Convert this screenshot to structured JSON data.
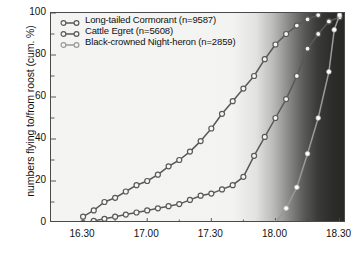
{
  "chart_data": {
    "type": "line",
    "title": "",
    "xlabel": "",
    "ylabel": "numbers flying to/from roost (cum. %)",
    "xlim": [
      16.25,
      18.55
    ],
    "ylim": [
      0,
      100
    ],
    "grid": false,
    "legend_position": "top-left",
    "annotations": [
      "shaded dark band at right of plot indicates nightfall / darkness"
    ],
    "xticks": [
      {
        "value": 16.5,
        "label": "16.30"
      },
      {
        "value": 17.0,
        "label": "17.00"
      },
      {
        "value": 17.5,
        "label": "17.30"
      },
      {
        "value": 18.0,
        "label": "18.00"
      },
      {
        "value": 18.5,
        "label": "18.30"
      }
    ],
    "yticks": [
      {
        "value": 0,
        "label": "0"
      },
      {
        "value": 20,
        "label": "20"
      },
      {
        "value": 40,
        "label": "40"
      },
      {
        "value": 60,
        "label": "60"
      },
      {
        "value": 80,
        "label": "80"
      },
      {
        "value": 100,
        "label": "100"
      }
    ],
    "series": [
      {
        "name": "Long-tailed Cormorant (n=9587)",
        "species": "Long-tailed Cormorant",
        "n": 9587,
        "color": "#595959",
        "marker": "open-circle",
        "x": [
          16.5,
          16.5833,
          16.6667,
          16.75,
          16.8333,
          16.9167,
          17.0,
          17.0833,
          17.1667,
          17.25,
          17.3333,
          17.4167,
          17.5,
          17.5833,
          17.6667,
          17.75,
          17.8333,
          17.9167,
          18.0,
          18.0833,
          18.1667,
          18.25,
          18.3333
        ],
        "y": [
          3,
          6,
          10,
          12,
          15,
          18,
          20,
          23,
          27,
          30,
          34,
          39,
          45,
          52,
          58,
          64,
          70,
          78,
          85,
          90,
          94,
          97,
          99
        ]
      },
      {
        "name": "Cattle Egret (n=5608)",
        "species": "Cattle Egret",
        "n": 5608,
        "color": "#595959",
        "marker": "open-circle",
        "x": [
          16.5,
          16.5833,
          16.6667,
          16.75,
          16.8333,
          16.9167,
          17.0,
          17.0833,
          17.1667,
          17.25,
          17.3333,
          17.4167,
          17.5,
          17.5833,
          17.6667,
          17.75,
          17.8333,
          17.9167,
          18.0,
          18.0833,
          18.1667,
          18.25,
          18.3333,
          18.4167,
          18.5
        ],
        "y": [
          0,
          1,
          2,
          3,
          4,
          5,
          6,
          7,
          8,
          9,
          11,
          13,
          14,
          16,
          18,
          22,
          32,
          41,
          50,
          59,
          70,
          83,
          90,
          96,
          98
        ]
      },
      {
        "name": "Black-crowned Night-heron (n=2859)",
        "species": "Black-crowned Night-heron",
        "n": 2859,
        "color": "#9a9a9a",
        "marker": "filled-circle-white",
        "x": [
          18.0,
          18.0833,
          18.1667,
          18.25,
          18.3333,
          18.4167,
          18.4583,
          18.5
        ],
        "y": [
          0,
          7,
          17,
          33,
          50,
          72,
          92,
          99
        ]
      }
    ]
  },
  "legend": {
    "items": [
      {
        "label": "Long-tailed Cormorant (n=9587)"
      },
      {
        "label": "Cattle Egret (n=5608)"
      },
      {
        "label": "Black-crowned Night-heron (n=2859)"
      }
    ]
  }
}
